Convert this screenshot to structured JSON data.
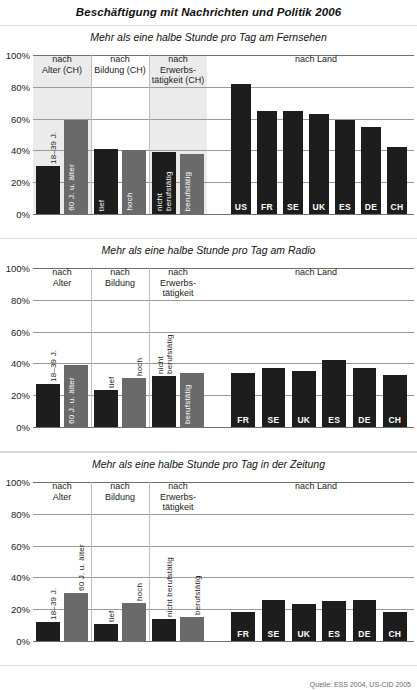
{
  "title": "Beschäftigung mit Nachrichten und Politik 2006",
  "source": "Quelle: ESS 2004, US-CID 2005",
  "axis": {
    "ticks": [
      "100%",
      "80%",
      "60%",
      "40%",
      "20%",
      "0%"
    ],
    "values": [
      100,
      80,
      60,
      40,
      20,
      0
    ],
    "ymin": 0,
    "ymax": 100
  },
  "chart_data": [
    {
      "type": "bar",
      "title": "Mehr als eine halbe Stunde pro Tag am Fernsehen",
      "ylabel": "",
      "xlabel": "",
      "ylim": [
        0,
        100
      ],
      "grid": true,
      "groups": [
        {
          "label": "nach\nAlter (CH)",
          "categories": [
            "18–39 J.",
            "60 J. u. älter"
          ],
          "values": [
            30,
            59
          ],
          "shades": [
            "dark",
            "mid"
          ]
        },
        {
          "label": "nach\nBildung (CH)",
          "categories": [
            "tief",
            "hoch"
          ],
          "values": [
            41,
            40
          ],
          "shades": [
            "dark",
            "mid"
          ]
        },
        {
          "label": "nach\nErwerbs-\ntätigkeit (CH)",
          "categories": [
            "nicht\nberufstätig",
            "berufstätig"
          ],
          "values": [
            39,
            38
          ],
          "shades": [
            "dark",
            "mid"
          ]
        },
        {
          "label": "nach Land",
          "categories": [
            "US",
            "FR",
            "SE",
            "UK",
            "ES",
            "DE",
            "CH"
          ],
          "values": [
            82,
            65,
            65,
            63,
            59,
            55,
            42
          ],
          "shades": [
            "dark",
            "dark",
            "dark",
            "dark",
            "dark",
            "dark",
            "dark"
          ]
        }
      ]
    },
    {
      "type": "bar",
      "title": "Mehr als eine halbe Stunde pro Tag am Radio",
      "ylabel": "",
      "xlabel": "",
      "ylim": [
        0,
        100
      ],
      "grid": true,
      "groups": [
        {
          "label": "nach\nAlter",
          "categories": [
            "18–39 J.",
            "60 J. u. älter"
          ],
          "values": [
            27,
            39
          ],
          "shades": [
            "dark",
            "mid"
          ]
        },
        {
          "label": "nach\nBildung",
          "categories": [
            "tief",
            "hoch"
          ],
          "values": [
            23,
            31
          ],
          "shades": [
            "dark",
            "mid"
          ]
        },
        {
          "label": "nach\nErwerbs-\ntätigkeit",
          "categories": [
            "nicht\nberufstätig",
            "berufstätig"
          ],
          "values": [
            32,
            34
          ],
          "shades": [
            "dark",
            "mid"
          ]
        },
        {
          "label": "nach Land",
          "categories": [
            "FR",
            "SE",
            "UK",
            "ES",
            "DE",
            "CH"
          ],
          "values": [
            34,
            37,
            35,
            42,
            37,
            33
          ],
          "shades": [
            "dark",
            "dark",
            "dark",
            "dark",
            "dark",
            "dark"
          ]
        }
      ]
    },
    {
      "type": "bar",
      "title": "Mehr als eine halbe Stunde pro Tag in der Zeitung",
      "ylabel": "",
      "xlabel": "",
      "ylim": [
        0,
        100
      ],
      "grid": true,
      "groups": [
        {
          "label": "nach\nAlter",
          "categories": [
            "18–39 J.",
            "60 J. u. älter"
          ],
          "values": [
            12,
            30
          ],
          "shades": [
            "dark",
            "mid"
          ]
        },
        {
          "label": "nach\nBildung",
          "categories": [
            "tief",
            "hoch"
          ],
          "values": [
            11,
            24
          ],
          "shades": [
            "dark",
            "mid"
          ]
        },
        {
          "label": "nach\nErwerbs-\ntätigkeit",
          "categories": [
            "nicht berufstätig",
            "berufstätig"
          ],
          "values": [
            14,
            15
          ],
          "shades": [
            "dark",
            "mid"
          ]
        },
        {
          "label": "nach Land",
          "categories": [
            "FR",
            "SE",
            "UK",
            "ES",
            "DE",
            "CH"
          ],
          "values": [
            18,
            26,
            23,
            25,
            26,
            18
          ],
          "shades": [
            "dark",
            "dark",
            "dark",
            "dark",
            "dark",
            "dark"
          ]
        }
      ]
    }
  ]
}
